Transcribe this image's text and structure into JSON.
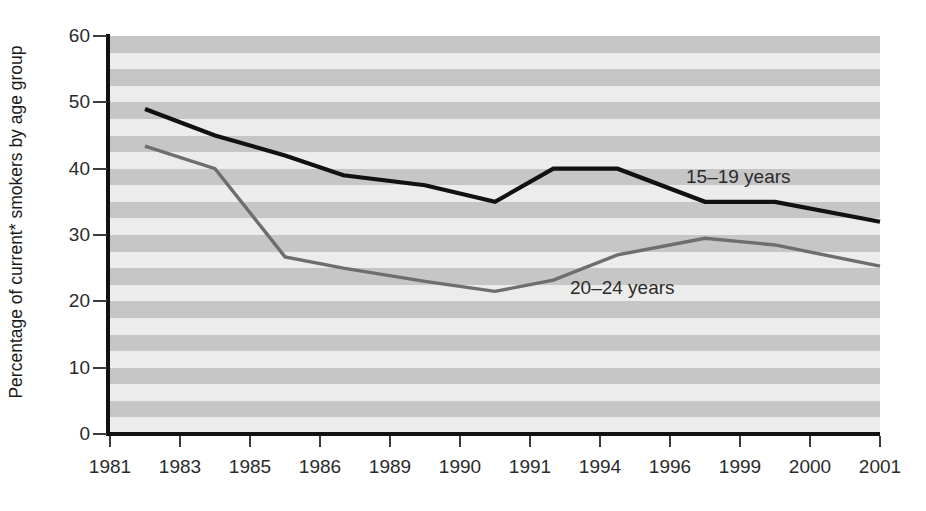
{
  "chart_data": {
    "type": "line",
    "title": "",
    "xlabel": "",
    "ylabel": "Percentage of current* smokers by age group",
    "ylim": [
      0,
      60
    ],
    "yticks": [
      0,
      10,
      20,
      30,
      40,
      50,
      60
    ],
    "grid": "horizontal-bands",
    "legend_position": "inline-annotation",
    "categories": [
      "1981",
      "1983",
      "1985",
      "1986",
      "1989",
      "1990",
      "1991",
      "1994",
      "1996",
      "1999",
      "2000",
      "2001"
    ],
    "series": [
      {
        "name": "15–19 years",
        "color": "#111111",
        "x": [
          1982,
          1984,
          1985.5,
          1987,
          1989.5,
          1990.5,
          1992,
          1994.5,
          1997.5,
          1999.5,
          2001
        ],
        "values": [
          49,
          45,
          42,
          39,
          37.5,
          35,
          40,
          40,
          35,
          35,
          32
        ]
      },
      {
        "name": "20–24 years",
        "color": "#6e6e6e",
        "x": [
          1982,
          1984,
          1985.5,
          1987,
          1989.5,
          1990.5,
          1992,
          1994.5,
          1997.5,
          1999.5,
          2001
        ],
        "values": [
          43.4,
          40,
          26.7,
          25,
          23,
          21.5,
          23.2,
          27,
          29.5,
          28.5,
          25.3
        ]
      }
    ],
    "annotations": [
      {
        "text": "15–19 years",
        "x_px": 686,
        "y_px": 167
      },
      {
        "text": "20–24 years",
        "x_px": 570,
        "y_px": 278
      }
    ]
  },
  "axes": {
    "y_tick_labels": [
      "60",
      "50",
      "40",
      "30",
      "20",
      "10",
      "0"
    ],
    "x_tick_labels": [
      "1981",
      "1983",
      "1985",
      "1986",
      "1989",
      "1990",
      "1991",
      "1994",
      "1996",
      "1999",
      "2000",
      "2001"
    ],
    "y_title": "Percentage of current* smokers by age group"
  },
  "colors": {
    "series_15_19": "#111111",
    "series_20_24": "#6e6e6e",
    "band_light": "#ececec",
    "band_dark": "#c6c6c6",
    "axis": "#111111",
    "text": "#2b2b2b"
  }
}
